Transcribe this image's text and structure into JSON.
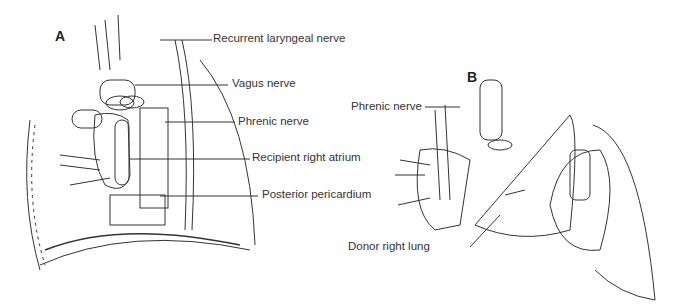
{
  "figure": {
    "panels": [
      {
        "letter": "A",
        "labels": [
          "Recurrent laryngeal nerve",
          "Vagus nerve",
          "Phrenic nerve",
          "Recipient right atrium",
          "Posterior pericardium"
        ]
      },
      {
        "letter": "B",
        "labels": [
          "Phrenic nerve",
          "Donor right lung"
        ]
      }
    ]
  }
}
